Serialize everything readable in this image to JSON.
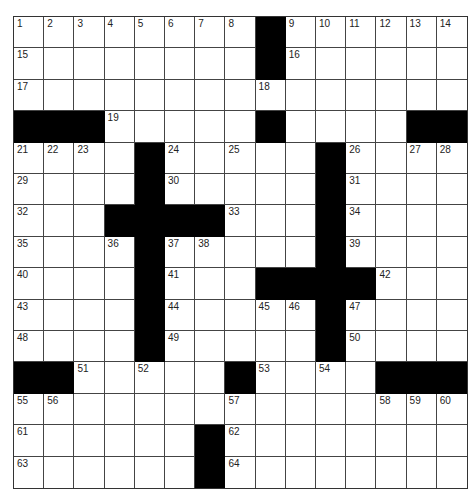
{
  "puzzle": {
    "rows": 15,
    "cols": 15,
    "colors": {
      "black_square": "#000000",
      "white_square": "#ffffff",
      "grid_line": "#444444"
    },
    "grid": [
      "........#......",
      "........#......",
      "...............",
      "###.....#....##",
      "....#.....#....",
      "....#.....#....",
      "...####...#....",
      "....#.....#....",
      "....#...####...",
      "....#.....#....",
      "....#.....#....",
      "##.....#....###",
      "...............",
      "......#........",
      "......#........"
    ],
    "numbers": [
      [
        1,
        2,
        3,
        4,
        5,
        6,
        7,
        8,
        0,
        9,
        10,
        11,
        12,
        13,
        14
      ],
      [
        15,
        0,
        0,
        0,
        0,
        0,
        0,
        0,
        0,
        16,
        0,
        0,
        0,
        0,
        0
      ],
      [
        17,
        0,
        0,
        0,
        0,
        0,
        0,
        0,
        18,
        0,
        0,
        0,
        0,
        0,
        0
      ],
      [
        0,
        0,
        0,
        19,
        0,
        0,
        0,
        0,
        20,
        0,
        0,
        0,
        0,
        0,
        0
      ],
      [
        21,
        22,
        23,
        0,
        0,
        24,
        0,
        25,
        0,
        0,
        0,
        26,
        0,
        27,
        28
      ],
      [
        29,
        0,
        0,
        0,
        0,
        30,
        0,
        0,
        0,
        0,
        0,
        31,
        0,
        0,
        0
      ],
      [
        32,
        0,
        0,
        0,
        0,
        0,
        0,
        33,
        0,
        0,
        0,
        34,
        0,
        0,
        0
      ],
      [
        35,
        0,
        0,
        36,
        0,
        37,
        38,
        0,
        0,
        0,
        0,
        39,
        0,
        0,
        0
      ],
      [
        40,
        0,
        0,
        0,
        0,
        41,
        0,
        0,
        0,
        0,
        0,
        0,
        42,
        0,
        0
      ],
      [
        43,
        0,
        0,
        0,
        0,
        44,
        0,
        0,
        45,
        46,
        0,
        47,
        0,
        0,
        0
      ],
      [
        48,
        0,
        0,
        0,
        0,
        49,
        0,
        0,
        0,
        0,
        0,
        50,
        0,
        0,
        0
      ],
      [
        0,
        0,
        51,
        0,
        52,
        0,
        0,
        0,
        53,
        0,
        54,
        0,
        0,
        0,
        0
      ],
      [
        55,
        56,
        0,
        0,
        0,
        0,
        0,
        57,
        0,
        0,
        0,
        0,
        58,
        59,
        60
      ],
      [
        61,
        0,
        0,
        0,
        0,
        0,
        0,
        62,
        0,
        0,
        0,
        0,
        0,
        0,
        0
      ],
      [
        63,
        0,
        0,
        0,
        0,
        0,
        0,
        64,
        0,
        0,
        0,
        0,
        0,
        0,
        0
      ]
    ],
    "letters": []
  }
}
